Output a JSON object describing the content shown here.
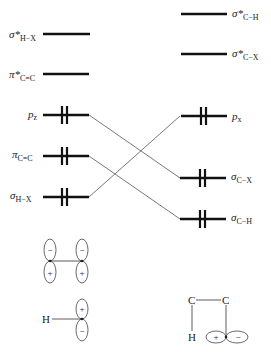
{
  "diagram": {
    "left_levels": [
      {
        "id": "sigma-star-h-x",
        "symbol": "σ*",
        "subscript": "H−X",
        "y": 34,
        "electrons": 0
      },
      {
        "id": "pi-star-c-c",
        "symbol": "π*",
        "subscript": "C=C",
        "y": 74,
        "electrons": 0
      },
      {
        "id": "p-z",
        "symbol": "p",
        "subscript": "z",
        "y": 115,
        "electrons": 2
      },
      {
        "id": "pi-c-c",
        "symbol": "π",
        "subscript": "C=C",
        "y": 156,
        "electrons": 2
      },
      {
        "id": "sigma-h-x",
        "symbol": "σ",
        "subscript": "H−X",
        "y": 197,
        "electrons": 2
      }
    ],
    "right_levels": [
      {
        "id": "sigma-star-c-h",
        "symbol": "σ*",
        "subscript": "C−H",
        "y": 14,
        "electrons": 0
      },
      {
        "id": "sigma-star-c-x",
        "symbol": "σ*",
        "subscript": "C−X",
        "y": 54,
        "electrons": 0
      },
      {
        "id": "p-x",
        "symbol": "p",
        "subscript": "x",
        "y": 116,
        "electrons": 2
      },
      {
        "id": "sigma-c-x",
        "symbol": "σ",
        "subscript": "C−X",
        "y": 178,
        "electrons": 2
      },
      {
        "id": "sigma-c-h",
        "symbol": "σ",
        "subscript": "C−H",
        "y": 219,
        "electrons": 2
      }
    ],
    "correlations": [
      {
        "from": "p-z",
        "to": "sigma-c-x"
      },
      {
        "from": "pi-c-c",
        "to": "sigma-c-h"
      },
      {
        "from": "sigma-h-x",
        "to": "p-x"
      }
    ],
    "sketches": {
      "pi_bond": {
        "top_sign": "−",
        "bottom_sign": "+"
      },
      "h_p_orbital": {
        "atom": "H",
        "top_sign": "+",
        "bottom_sign": "−"
      },
      "c_c_h": {
        "atoms": [
          "C",
          "C",
          "H"
        ],
        "left_sign": "+",
        "right_sign": "−"
      }
    }
  }
}
